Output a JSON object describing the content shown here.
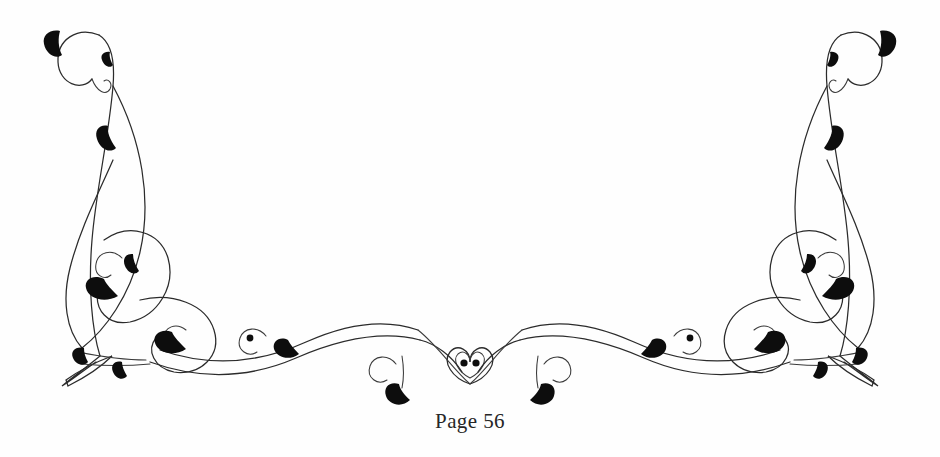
{
  "page": {
    "background_color": "#fefefe",
    "width": 940,
    "height": 457
  },
  "ornament": {
    "name": "decorative-flourish-vignette",
    "description": "Symmetric calligraphic tailpiece flourish with scrolling tendrils and filled leaf accents",
    "ink_color": "#2b2b2b",
    "leaf_color": "#0d0d0d",
    "symmetry": "mirrored-left-right",
    "center_motif": "teardrop-with-two-dots"
  },
  "caption": {
    "text": "Page 56",
    "label": "Page",
    "number": "56",
    "color": "#262626"
  }
}
